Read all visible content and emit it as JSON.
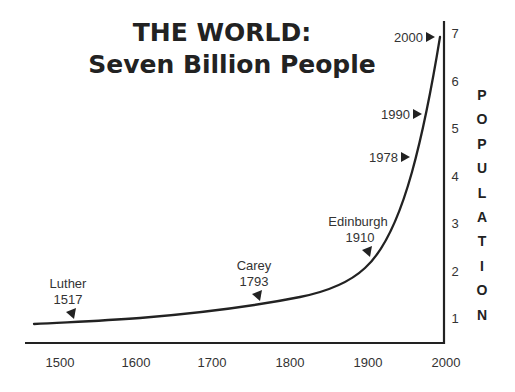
{
  "title": {
    "line1": "THE WORLD:",
    "line2": "Seven Billion People"
  },
  "y_axis_label": "POPULATION",
  "chart_data": {
    "type": "line",
    "title": "THE WORLD: Seven Billion People",
    "xlabel": "",
    "ylabel": "POPULATION",
    "unit": "billions",
    "xlim": [
      1460,
      2000
    ],
    "ylim": [
      0.5,
      7.3
    ],
    "x_ticks": [
      1500,
      1600,
      1700,
      1800,
      1900,
      2000
    ],
    "y_ticks": [
      1,
      2,
      3,
      4,
      5,
      6,
      7
    ],
    "grid": false,
    "legend": "none",
    "series": [
      {
        "name": "World population (billions)",
        "x": [
          1465,
          1500,
          1550,
          1600,
          1650,
          1700,
          1750,
          1800,
          1825,
          1850,
          1875,
          1900,
          1925,
          1950,
          1960,
          1970,
          1980,
          1990,
          2000
        ],
        "values": [
          0.87,
          0.9,
          0.95,
          1.0,
          1.05,
          1.15,
          1.28,
          1.45,
          1.57,
          1.7,
          1.95,
          2.3,
          2.8,
          3.5,
          4.0,
          4.6,
          5.3,
          6.1,
          6.95
        ]
      }
    ],
    "annotations": [
      {
        "label": "Luther",
        "year": "1517"
      },
      {
        "label": "Carey",
        "year": "1793"
      },
      {
        "label": "Edinburgh",
        "year": "1910"
      },
      {
        "label": "",
        "year": "1978"
      },
      {
        "label": "",
        "year": "1990"
      },
      {
        "label": "",
        "year": "2000"
      }
    ]
  },
  "ticks": {
    "x": [
      "1500",
      "1600",
      "1700",
      "1800",
      "1900",
      "2000"
    ],
    "y": [
      "1",
      "2",
      "3",
      "4",
      "5",
      "6",
      "7"
    ]
  },
  "annotations": {
    "luther": {
      "name": "Luther",
      "year": "1517"
    },
    "carey": {
      "name": "Carey",
      "year": "1793"
    },
    "edinburgh": {
      "name": "Edinburgh",
      "year": "1910"
    },
    "y1978": {
      "year": "1978"
    },
    "y1990": {
      "year": "1990"
    },
    "y2000": {
      "year": "2000"
    }
  },
  "colors": {
    "ink": "#222222",
    "background": "#ffffff"
  }
}
